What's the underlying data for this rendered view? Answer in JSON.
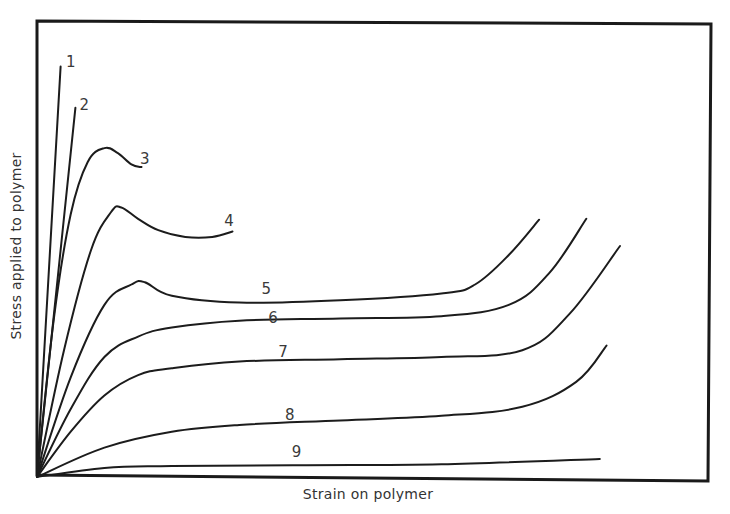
{
  "chart_data": {
    "type": "line",
    "title": "",
    "xlabel": "Strain on polymer",
    "ylabel": "Stress applied to polymer",
    "grid": false,
    "legend": "inline numeric labels at curve ends / along curves",
    "axis_ticks": "none (qualitative axes)",
    "xlim": [
      0,
      100
    ],
    "ylim": [
      0,
      100
    ],
    "series": [
      {
        "name": "1",
        "label_pos": [
          5,
          90.5
        ],
        "x": [
          0,
          3.5
        ],
        "y": [
          0,
          90.6
        ]
      },
      {
        "name": "2",
        "label_pos": [
          7,
          81
        ],
        "x": [
          0,
          5.7
        ],
        "y": [
          0,
          81.5
        ]
      },
      {
        "name": "3",
        "label_pos": [
          16,
          69
        ],
        "x": [
          0,
          2.5,
          5,
          7.5,
          10,
          12,
          14,
          15.5
        ],
        "y": [
          0,
          35,
          58,
          69.5,
          72.6,
          71.5,
          69,
          68.4
        ]
      },
      {
        "name": "4",
        "label_pos": [
          28.5,
          55.5
        ],
        "x": [
          0,
          4,
          8,
          11,
          12.5,
          15,
          18,
          22,
          26,
          29
        ],
        "y": [
          0,
          28,
          50,
          58.5,
          59.5,
          57,
          54.5,
          53,
          53,
          54.2
        ]
      },
      {
        "name": "5",
        "label_pos": [
          34,
          40.5
        ],
        "x": [
          0,
          5,
          10,
          14,
          16,
          20,
          30,
          45,
          60,
          65,
          70,
          74.5
        ],
        "y": [
          0,
          22,
          38,
          42.5,
          43,
          40,
          38.5,
          39,
          40.5,
          42.5,
          49,
          56.8
        ]
      },
      {
        "name": "6",
        "label_pos": [
          35,
          34
        ],
        "x": [
          0,
          5,
          10,
          15,
          20,
          30,
          45,
          60,
          70,
          76,
          81.5
        ],
        "y": [
          0,
          15,
          26.5,
          31,
          33,
          34.5,
          35,
          35.5,
          38,
          45,
          57
        ]
      },
      {
        "name": "7",
        "label_pos": [
          36.5,
          26.5
        ],
        "x": [
          0,
          5,
          10,
          15,
          20,
          30,
          45,
          60,
          72,
          79,
          86.5
        ],
        "y": [
          0,
          10,
          18,
          22.5,
          24,
          25.5,
          26,
          26.5,
          28,
          36,
          51
        ]
      },
      {
        "name": "8",
        "label_pos": [
          37.5,
          12.5
        ],
        "x": [
          0,
          10,
          20,
          30,
          45,
          60,
          72,
          80,
          84.5
        ],
        "y": [
          0,
          6.5,
          10,
          11.5,
          12.5,
          13.5,
          15.5,
          21,
          29
        ]
      },
      {
        "name": "9",
        "label_pos": [
          38.5,
          4.5
        ],
        "x": [
          0,
          10,
          20,
          40,
          60,
          83.5
        ],
        "y": [
          0,
          2,
          2.4,
          2.6,
          2.8,
          4.0
        ]
      }
    ]
  },
  "frame": {
    "stroke": "#1a1a1a",
    "plot_px": {
      "left": 37,
      "top": 24,
      "right": 711,
      "bottom": 477
    }
  }
}
